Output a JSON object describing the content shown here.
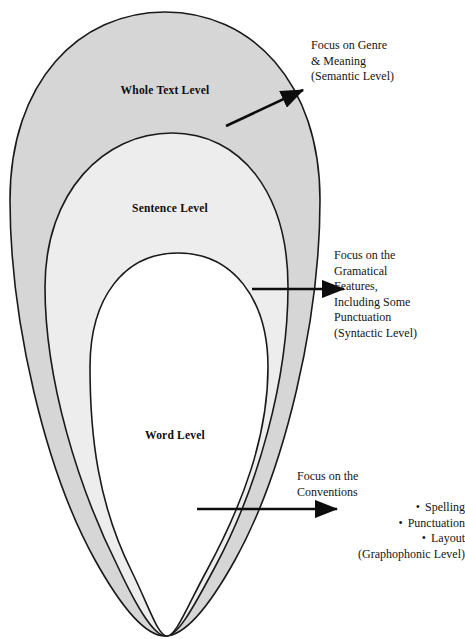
{
  "diagram": {
    "colors": {
      "outer_fill": "#d6d6d6",
      "middle_fill": "#ededed",
      "inner_fill": "#ffffff",
      "stroke": "#1a1a1a",
      "text": "#141414"
    },
    "levels": [
      {
        "id": "whole-text",
        "label": "Whole Text Level"
      },
      {
        "id": "sentence",
        "label": "Sentence Level"
      },
      {
        "id": "word",
        "label": "Word Level"
      }
    ],
    "annotations": [
      {
        "id": "semantic",
        "lines": [
          "Focus on Genre",
          "& Meaning",
          "(Semantic Level)"
        ]
      },
      {
        "id": "syntactic",
        "lines": [
          "Focus on the",
          "Gramatical",
          "Features,",
          "Including Some",
          "Punctuation",
          "(Syntactic Level)"
        ]
      },
      {
        "id": "graphophonic",
        "lines": [
          "Focus on the",
          "Conventions"
        ],
        "bullets": [
          "Spelling",
          "Punctuation",
          "Layout"
        ],
        "bullet_glyph": "•",
        "closing": "(Graphophonic Level)"
      }
    ]
  }
}
